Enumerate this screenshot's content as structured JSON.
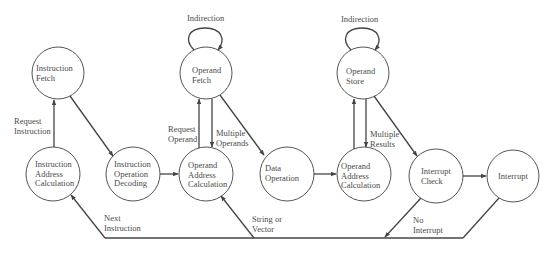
{
  "diagram": {
    "type": "state-diagram",
    "colors": {
      "stroke": "#444444",
      "text": "#4a4a4a",
      "background": "#ffffff"
    },
    "nodes": [
      {
        "id": "instruction_fetch",
        "lines": [
          "Instruction",
          "Fetch"
        ]
      },
      {
        "id": "instruction_address_calculation",
        "lines": [
          "Instruction",
          "Address",
          "Calculation"
        ]
      },
      {
        "id": "instruction_operation_decoding",
        "lines": [
          "Instruction",
          "Operation",
          "Decoding"
        ]
      },
      {
        "id": "operand_fetch",
        "lines": [
          "Operand",
          "Fetch"
        ]
      },
      {
        "id": "operand_address_calculation_1",
        "lines": [
          "Operand",
          "Address",
          "Calculation"
        ]
      },
      {
        "id": "data_operation",
        "lines": [
          "Data",
          "Operation"
        ]
      },
      {
        "id": "operand_store",
        "lines": [
          "Operand",
          "Store"
        ]
      },
      {
        "id": "operand_address_calculation_2",
        "lines": [
          "Operand",
          "Address",
          "Calculation"
        ]
      },
      {
        "id": "interrupt_check",
        "lines": [
          "Interrupt",
          "Check"
        ]
      },
      {
        "id": "interrupt",
        "lines": [
          "Interrupt"
        ]
      }
    ],
    "edge_labels": {
      "request_instruction": [
        "Request",
        "Instruction"
      ],
      "indirection_fetch": "Indirection",
      "indirection_store": "Indirection",
      "request_operand": [
        "Request",
        "Operand"
      ],
      "multiple_operands": [
        "Multiple",
        "Operands"
      ],
      "multiple_results": [
        "Multiple",
        "Results"
      ],
      "next_instruction": [
        "Next",
        "Instruction"
      ],
      "string_or_vector": [
        "String or",
        "Vector"
      ],
      "no_interrupt": [
        "No",
        "Interrupt"
      ]
    }
  }
}
